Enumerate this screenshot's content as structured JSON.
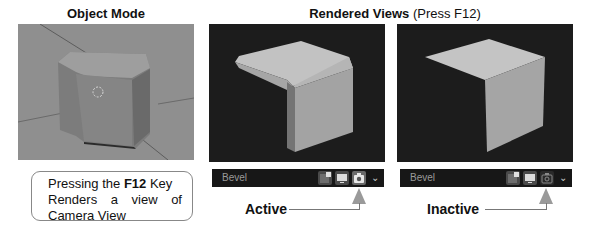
{
  "titles": {
    "object_mode": "Object Mode",
    "rendered_views_bold": "Rendered Views",
    "rendered_views_note": "(Press F12)"
  },
  "callout": {
    "line1_pre": "Pressing the ",
    "line1_key": "F12",
    "line1_post": " Key",
    "line2_words": [
      "Renders",
      "a",
      "view",
      "of"
    ],
    "line3": "Camera View"
  },
  "render_headers": [
    {
      "label": "Bevel",
      "state": "Active",
      "icons": [
        "image-editor-icon",
        "display-icon",
        "camera-icon"
      ],
      "camera_active": true
    },
    {
      "label": "Bevel",
      "state": "Inactive",
      "icons": [
        "image-editor-icon",
        "display-icon",
        "camera-icon"
      ],
      "camera_active": false
    }
  ],
  "colors": {
    "viewport_bg": "#8e8e8e",
    "render_bg": "#1e1e1e",
    "header_bg": "#171717",
    "cube_light": "#c4c4c4",
    "cube_mid": "#9c9c9c",
    "cube_dark": "#6e6e6e"
  }
}
